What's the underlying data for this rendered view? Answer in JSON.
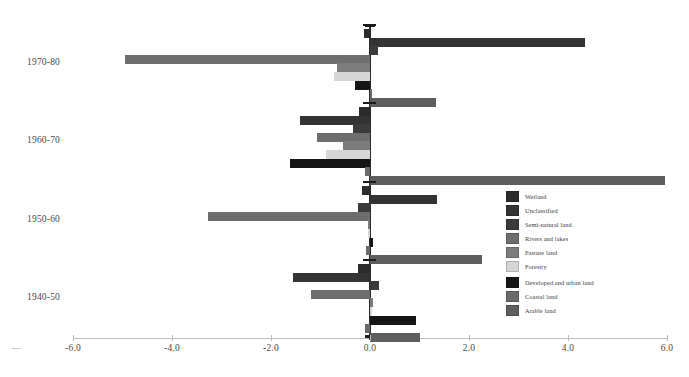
{
  "chart_data": {
    "type": "bar",
    "orientation": "horizontal",
    "title": "",
    "xlabel": "",
    "ylabel": "",
    "xlim": [
      -6.0,
      6.0
    ],
    "xticks": [
      "-6.0",
      "-4.0",
      "-2.0",
      "0.0",
      "2.0",
      "4.0",
      "6.0"
    ],
    "xtick_values": [
      -6.0,
      -4.0,
      -2.0,
      0.0,
      2.0,
      4.0,
      6.0
    ],
    "grid": false,
    "legend_position": "center-right",
    "categories": [
      "1970-80",
      "1960-70",
      "1950-60",
      "1940-50"
    ],
    "series": [
      {
        "name": "Wetland",
        "color": "#2b2b2b",
        "values": [
          -0.13,
          -0.22,
          -0.16,
          -0.24
        ]
      },
      {
        "name": "Unclassified",
        "color": "#333333",
        "values": [
          4.34,
          -1.42,
          1.35,
          -1.55
        ]
      },
      {
        "name": "Semi-natural land",
        "color": "#3b3b3b",
        "values": [
          0.16,
          -0.35,
          -0.25,
          0.18
        ]
      },
      {
        "name": "Rivers and lakes",
        "color": "#6e6e6e",
        "values": [
          -4.95,
          -1.07,
          -3.28,
          -1.2
        ]
      },
      {
        "name": "Pasture land",
        "color": "#7c7c7c",
        "values": [
          -0.67,
          -0.55,
          -0.05,
          0.06
        ]
      },
      {
        "name": "Forestry",
        "color": "#d6d6d6",
        "values": [
          -0.72,
          -0.88,
          -0.04,
          0.03
        ]
      },
      {
        "name": "Developed and urban land",
        "color": "#151515",
        "values": [
          -0.31,
          -1.62,
          0.07,
          0.92
        ]
      },
      {
        "name": "Coastal land",
        "color": "#6a6a6a",
        "values": [
          0.02,
          -0.1,
          -0.09,
          -0.11
        ]
      },
      {
        "name": "Arable land",
        "color": "#5e5e5e",
        "values": [
          1.33,
          5.95,
          2.27,
          1.0
        ]
      }
    ]
  },
  "legend": {
    "items": [
      {
        "label": "Wetland"
      },
      {
        "label": "Unclassified"
      },
      {
        "label": "Semi-natural land"
      },
      {
        "label": "Rivers and lakes"
      },
      {
        "label": "Pasture land"
      },
      {
        "label": "Forestry"
      },
      {
        "label": "Developed and urban land"
      },
      {
        "label": "Coastal land"
      },
      {
        "label": "Arable land"
      }
    ]
  }
}
